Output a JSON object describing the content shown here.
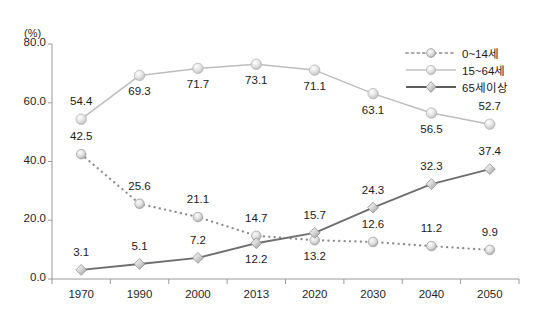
{
  "chart_data": {
    "type": "line",
    "title": "",
    "subtitle": "",
    "xlabel": "",
    "ylabel": "",
    "unit_label": "(%)",
    "categories": [
      "1970",
      "1990",
      "2000",
      "2013",
      "2020",
      "2030",
      "2040",
      "2050"
    ],
    "x_tick_labels": [
      "1970",
      "1990",
      "2000",
      "2013",
      "2020",
      "2030",
      "2040",
      "2050"
    ],
    "y_tick_labels": [
      "0.0",
      "20.0",
      "40.0",
      "60.0",
      "80.0"
    ],
    "y_ticks": [
      0,
      20,
      40,
      60,
      80
    ],
    "ylim": [
      0,
      80
    ],
    "grid": false,
    "legend_position": "top-right",
    "series": [
      {
        "name": "0~14세",
        "color": "#8c8c8c",
        "line_style": "dotted",
        "marker": "circle",
        "values": [
          42.5,
          25.6,
          21.1,
          14.7,
          13.2,
          12.6,
          11.2,
          9.9
        ],
        "label_positions": [
          "above",
          "above",
          "above",
          "above",
          "below",
          "above",
          "above",
          "above"
        ]
      },
      {
        "name": "15~64세",
        "color": "#bdbdbd",
        "line_style": "solid",
        "marker": "circle",
        "values": [
          54.4,
          69.3,
          71.7,
          73.1,
          71.1,
          63.1,
          56.5,
          52.7
        ],
        "label_positions": [
          "above",
          "below",
          "below",
          "below",
          "below",
          "below",
          "below",
          "above"
        ]
      },
      {
        "name": "65세이상",
        "color": "#6e6e6e",
        "line_style": "solid",
        "marker": "diamond",
        "values": [
          3.1,
          5.1,
          7.2,
          12.2,
          15.7,
          24.3,
          32.3,
          37.4
        ],
        "label_positions": [
          "above",
          "above",
          "above",
          "below",
          "above",
          "above",
          "above",
          "above"
        ]
      }
    ]
  },
  "legend": {
    "items": [
      {
        "label": "0~14세"
      },
      {
        "label": "15~64세"
      },
      {
        "label": "65세이상"
      }
    ]
  },
  "axes": {
    "unit": "(%)"
  }
}
